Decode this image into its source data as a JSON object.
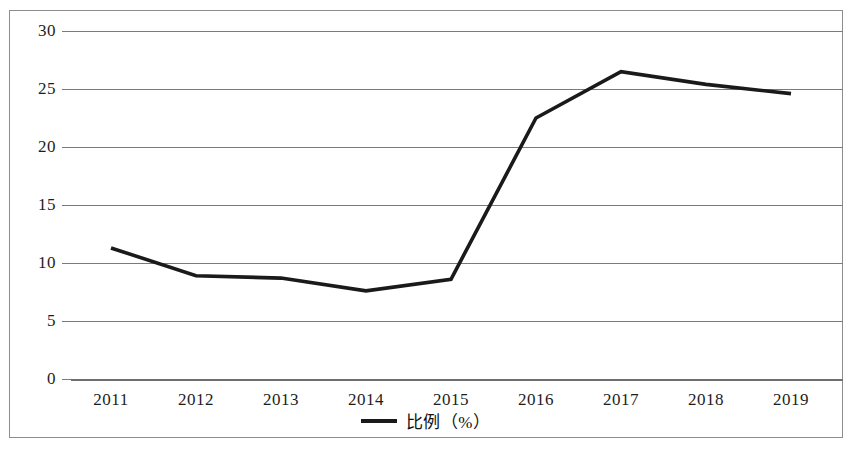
{
  "chart_data": {
    "type": "line",
    "title": "",
    "subtitle": "",
    "xlabel": "",
    "ylabel": "",
    "categories": [
      "2011",
      "2012",
      "2013",
      "2014",
      "2015",
      "2016",
      "2017",
      "2018",
      "2019"
    ],
    "series": [
      {
        "name": "比例（%）",
        "values": [
          11.3,
          8.9,
          8.7,
          7.6,
          8.6,
          22.5,
          26.5,
          25.4,
          24.6
        ]
      }
    ],
    "ylim": [
      0,
      30
    ],
    "yticks": [
      0,
      5,
      10,
      15,
      20,
      25,
      30
    ],
    "ytick_labels": [
      "0",
      "5",
      "10",
      "15",
      "20",
      "25",
      "30"
    ],
    "xtick_labels": [
      "2011",
      "2012",
      "2013",
      "2014",
      "2015",
      "2016",
      "2017",
      "2018",
      "2019"
    ],
    "grid": true,
    "grid_axis": "y",
    "legend": {
      "position": "bottom-center",
      "entries": [
        {
          "label": "比例（%）",
          "marker": "line",
          "color": "#1a1a1a"
        }
      ]
    },
    "colors": {
      "series_line": "#1a1a1a",
      "gridline": "#7a7a7a",
      "frame_border": "#8d8d8d",
      "tick_text": "#1d1d1d",
      "background": "#ffffff"
    }
  }
}
